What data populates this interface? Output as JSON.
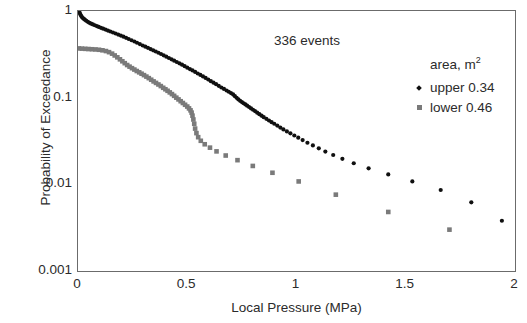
{
  "chart_data": {
    "type": "scatter",
    "title": "",
    "xlabel": "Local Pressure (MPa)",
    "ylabel": "Probability of Exceedance",
    "xlim": [
      0,
      2
    ],
    "ylim": [
      0.001,
      1
    ],
    "yscale": "log",
    "grid": false,
    "legend_position": "inside-top-right",
    "annotations": [
      {
        "name": "events-count",
        "text": "336 events"
      }
    ],
    "legend_title": "area, m",
    "legend_title_sup": "2",
    "xticks": [
      "0",
      "0.5",
      "1",
      "1.5",
      "2"
    ],
    "xtick_values": [
      0,
      0.5,
      1,
      1.5,
      2
    ],
    "yticks": [
      "1",
      "0.1",
      "0.01",
      "0.001"
    ],
    "ytick_values": [
      1,
      0.1,
      0.01,
      0.001
    ],
    "series": [
      {
        "name": "upper 0.34",
        "marker": "diamond",
        "color": "#101010",
        "points": [
          [
            0.005,
            1.0
          ],
          [
            0.008,
            0.95
          ],
          [
            0.011,
            0.91
          ],
          [
            0.014,
            0.88
          ],
          [
            0.018,
            0.85
          ],
          [
            0.022,
            0.83
          ],
          [
            0.027,
            0.81
          ],
          [
            0.032,
            0.79
          ],
          [
            0.038,
            0.77
          ],
          [
            0.045,
            0.75
          ],
          [
            0.052,
            0.73
          ],
          [
            0.06,
            0.715
          ],
          [
            0.068,
            0.7
          ],
          [
            0.077,
            0.685
          ],
          [
            0.086,
            0.67
          ],
          [
            0.095,
            0.655
          ],
          [
            0.105,
            0.64
          ],
          [
            0.115,
            0.625
          ],
          [
            0.126,
            0.61
          ],
          [
            0.137,
            0.595
          ],
          [
            0.148,
            0.58
          ],
          [
            0.16,
            0.565
          ],
          [
            0.172,
            0.55
          ],
          [
            0.184,
            0.535
          ],
          [
            0.196,
            0.52
          ],
          [
            0.208,
            0.505
          ],
          [
            0.22,
            0.49
          ],
          [
            0.232,
            0.475
          ],
          [
            0.245,
            0.46
          ],
          [
            0.258,
            0.445
          ],
          [
            0.27,
            0.43
          ],
          [
            0.283,
            0.415
          ],
          [
            0.296,
            0.4
          ],
          [
            0.308,
            0.388
          ],
          [
            0.32,
            0.376
          ],
          [
            0.332,
            0.364
          ],
          [
            0.344,
            0.352
          ],
          [
            0.356,
            0.341
          ],
          [
            0.368,
            0.33
          ],
          [
            0.38,
            0.319
          ],
          [
            0.392,
            0.308
          ],
          [
            0.404,
            0.297
          ],
          [
            0.416,
            0.287
          ],
          [
            0.428,
            0.277
          ],
          [
            0.44,
            0.267
          ],
          [
            0.452,
            0.258
          ],
          [
            0.464,
            0.249
          ],
          [
            0.476,
            0.24
          ],
          [
            0.488,
            0.231
          ],
          [
            0.5,
            0.222
          ],
          [
            0.512,
            0.214
          ],
          [
            0.524,
            0.206
          ],
          [
            0.536,
            0.198
          ],
          [
            0.548,
            0.19
          ],
          [
            0.56,
            0.183
          ],
          [
            0.572,
            0.176
          ],
          [
            0.584,
            0.169
          ],
          [
            0.596,
            0.162
          ],
          [
            0.608,
            0.155
          ],
          [
            0.62,
            0.149
          ],
          [
            0.632,
            0.143
          ],
          [
            0.644,
            0.137
          ],
          [
            0.656,
            0.131
          ],
          [
            0.668,
            0.126
          ],
          [
            0.68,
            0.121
          ],
          [
            0.69,
            0.117
          ],
          [
            0.7,
            0.113
          ],
          [
            0.71,
            0.109
          ],
          [
            0.718,
            0.104
          ],
          [
            0.726,
            0.0995
          ],
          [
            0.734,
            0.0955
          ],
          [
            0.742,
            0.092
          ],
          [
            0.75,
            0.089
          ],
          [
            0.758,
            0.0862
          ],
          [
            0.766,
            0.0835
          ],
          [
            0.774,
            0.0808
          ],
          [
            0.783,
            0.078
          ],
          [
            0.792,
            0.0752
          ],
          [
            0.801,
            0.0725
          ],
          [
            0.81,
            0.07
          ],
          [
            0.82,
            0.0672
          ],
          [
            0.83,
            0.0645
          ],
          [
            0.84,
            0.062
          ],
          [
            0.85,
            0.0596
          ],
          [
            0.862,
            0.057
          ],
          [
            0.874,
            0.0545
          ],
          [
            0.886,
            0.0522
          ],
          [
            0.898,
            0.05
          ],
          [
            0.912,
            0.0476
          ],
          [
            0.926,
            0.0452
          ],
          [
            0.94,
            0.043
          ],
          [
            0.956,
            0.0408
          ],
          [
            0.972,
            0.0388
          ],
          [
            0.99,
            0.0366
          ],
          [
            1.008,
            0.0345
          ],
          [
            1.028,
            0.0324
          ],
          [
            1.05,
            0.0302
          ],
          [
            1.075,
            0.0281
          ],
          [
            1.102,
            0.026
          ],
          [
            1.132,
            0.0239
          ],
          [
            1.168,
            0.0218
          ],
          [
            1.21,
            0.0197
          ],
          [
            1.262,
            0.0175
          ],
          [
            1.33,
            0.0153
          ],
          [
            1.42,
            0.013
          ],
          [
            1.53,
            0.0108
          ],
          [
            1.66,
            0.0086
          ],
          [
            1.8,
            0.0062
          ],
          [
            1.94,
            0.0038
          ]
        ]
      },
      {
        "name": "lower 0.46",
        "marker": "square",
        "color": "#7a7a7a",
        "points": [
          [
            0.004,
            0.37
          ],
          [
            0.018,
            0.368
          ],
          [
            0.033,
            0.366
          ],
          [
            0.048,
            0.364
          ],
          [
            0.064,
            0.362
          ],
          [
            0.08,
            0.36
          ],
          [
            0.096,
            0.357
          ],
          [
            0.112,
            0.352
          ],
          [
            0.128,
            0.345
          ],
          [
            0.142,
            0.335
          ],
          [
            0.156,
            0.322
          ],
          [
            0.168,
            0.307
          ],
          [
            0.18,
            0.292
          ],
          [
            0.192,
            0.277
          ],
          [
            0.203,
            0.263
          ],
          [
            0.214,
            0.25
          ],
          [
            0.225,
            0.238
          ],
          [
            0.236,
            0.228
          ],
          [
            0.247,
            0.219
          ],
          [
            0.258,
            0.211
          ],
          [
            0.269,
            0.203
          ],
          [
            0.28,
            0.196
          ],
          [
            0.291,
            0.189
          ],
          [
            0.302,
            0.182
          ],
          [
            0.313,
            0.175
          ],
          [
            0.324,
            0.168
          ],
          [
            0.335,
            0.161
          ],
          [
            0.346,
            0.154
          ],
          [
            0.357,
            0.148
          ],
          [
            0.368,
            0.142
          ],
          [
            0.379,
            0.136
          ],
          [
            0.39,
            0.13
          ],
          [
            0.4,
            0.125
          ],
          [
            0.41,
            0.12
          ],
          [
            0.42,
            0.115
          ],
          [
            0.43,
            0.11
          ],
          [
            0.44,
            0.105
          ],
          [
            0.45,
            0.1
          ],
          [
            0.46,
            0.0955
          ],
          [
            0.47,
            0.091
          ],
          [
            0.48,
            0.0868
          ],
          [
            0.49,
            0.0828
          ],
          [
            0.5,
            0.079
          ],
          [
            0.508,
            0.0752
          ],
          [
            0.515,
            0.0714
          ],
          [
            0.52,
            0.0672
          ],
          [
            0.524,
            0.062
          ],
          [
            0.528,
            0.056
          ],
          [
            0.532,
            0.05
          ],
          [
            0.536,
            0.044
          ],
          [
            0.542,
            0.039
          ],
          [
            0.55,
            0.035
          ],
          [
            0.562,
            0.0318
          ],
          [
            0.58,
            0.029
          ],
          [
            0.604,
            0.0265
          ],
          [
            0.634,
            0.024
          ],
          [
            0.676,
            0.0215
          ],
          [
            0.73,
            0.019
          ],
          [
            0.8,
            0.0163
          ],
          [
            0.89,
            0.0136
          ],
          [
            1.01,
            0.0108
          ],
          [
            1.18,
            0.0076
          ],
          [
            1.42,
            0.0048
          ],
          [
            1.7,
            0.003
          ]
        ]
      }
    ]
  }
}
